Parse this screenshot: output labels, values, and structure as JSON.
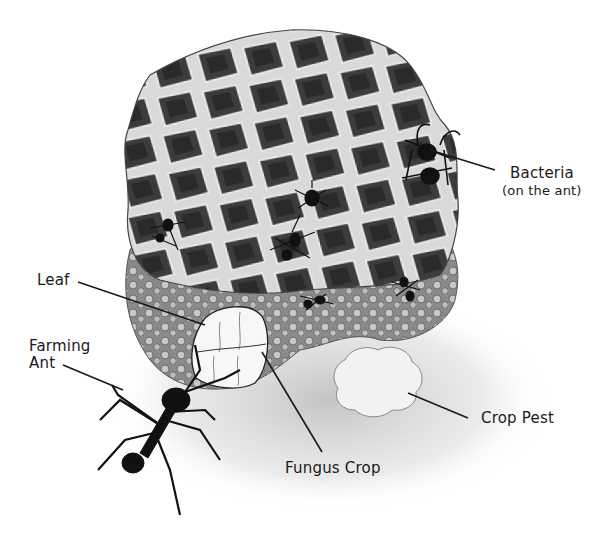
{
  "figure": {
    "style": "black-and-white stipple illustration"
  },
  "labels": {
    "bacteria": {
      "line1": "Bacteria",
      "line2": "(on the ant)"
    },
    "leaf": {
      "text": "Leaf"
    },
    "farming_ant": {
      "line1": "Farming",
      "line2": "Ant"
    },
    "fungus_crop": {
      "text": "Fungus Crop"
    },
    "crop_pest": {
      "text": "Crop Pest"
    }
  },
  "colors": {
    "ink": "#1a1a1a",
    "fungus_dark": "#3a3a3a",
    "fungus_mid": "#7a7a7a",
    "fungus_light": "#cfcfcf",
    "background": "#ffffff"
  }
}
